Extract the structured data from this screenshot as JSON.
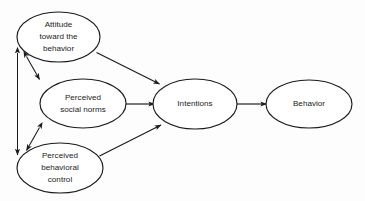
{
  "diagram": {
    "background_color": "#fdfdfd",
    "stroke_color": "#1a1a1a",
    "text_color": "#222222",
    "nodes": [
      {
        "id": "attitude",
        "lines": [
          "Attitude",
          "toward the",
          "behavior"
        ],
        "cx": 58.5,
        "cy": 37,
        "rx": 41.5,
        "ry": 25
      },
      {
        "id": "social-norms",
        "lines": [
          "Perceived",
          "social norms"
        ],
        "cx": 83,
        "cy": 103.5,
        "rx": 43,
        "ry": 24.5
      },
      {
        "id": "behavioral-control",
        "lines": [
          "Perceived",
          "behavioral",
          "control"
        ],
        "cx": 60,
        "cy": 168,
        "rx": 43,
        "ry": 25
      },
      {
        "id": "intentions",
        "lines": [
          "Intentions"
        ],
        "cx": 195,
        "cy": 104,
        "rx": 42,
        "ry": 25
      },
      {
        "id": "behavior",
        "lines": [
          "Behavior"
        ],
        "cx": 309,
        "cy": 104,
        "rx": 43,
        "ry": 24
      }
    ],
    "edges": [
      {
        "id": "attitude-to-intentions",
        "from": "attitude",
        "to": "intentions",
        "arrow": "single"
      },
      {
        "id": "social-norms-to-intentions",
        "from": "social-norms",
        "to": "intentions",
        "arrow": "single"
      },
      {
        "id": "behavioral-control-to-intentions",
        "from": "behavioral-control",
        "to": "intentions",
        "arrow": "single"
      },
      {
        "id": "intentions-to-behavior",
        "from": "intentions",
        "to": "behavior",
        "arrow": "single"
      },
      {
        "id": "attitude-social-norms-link",
        "from": "attitude",
        "to": "social-norms",
        "arrow": "double"
      },
      {
        "id": "social-norms-behavioral-control-link",
        "from": "social-norms",
        "to": "behavioral-control",
        "arrow": "double"
      },
      {
        "id": "attitude-behavioral-control-link",
        "from": "attitude",
        "to": "behavioral-control",
        "arrow": "double"
      }
    ]
  }
}
